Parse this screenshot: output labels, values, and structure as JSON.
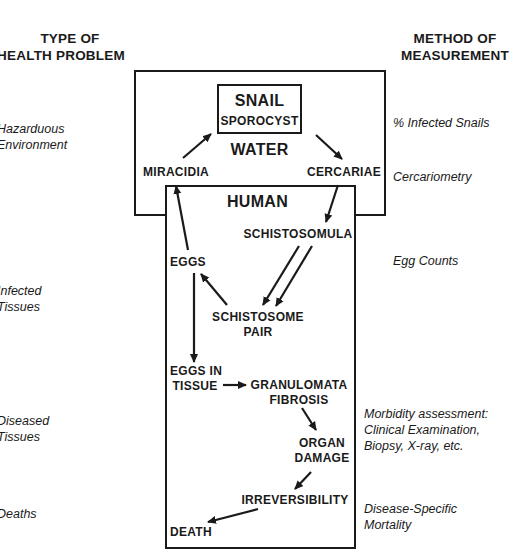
{
  "headers": {
    "left": [
      "TYPE OF",
      "HEALTH PROBLEM"
    ],
    "right": [
      "METHOD OF",
      "MEASUREMENT"
    ]
  },
  "health_problems": [
    {
      "lines": [
        "Hazarduous",
        "Environment"
      ]
    },
    {
      "lines": [
        "Infected",
        "Tissues"
      ]
    },
    {
      "lines": [
        "Diseased",
        "Tissues"
      ]
    },
    {
      "lines": [
        "Deaths"
      ]
    }
  ],
  "measurements": [
    {
      "lines": [
        "% Infected Snails"
      ]
    },
    {
      "lines": [
        "Cercariometry"
      ]
    },
    {
      "lines": [
        "Egg Counts"
      ]
    },
    {
      "lines": [
        "Morbidity assessment:",
        "Clinical Examination,",
        "Biopsy, X-ray, etc."
      ]
    },
    {
      "lines": [
        "Disease-Specific",
        "Mortality"
      ]
    }
  ],
  "diagram": {
    "snail_box": {
      "title": "SNAIL",
      "subtitle": "SPOROCYST"
    },
    "water_label": "WATER",
    "human_label": "HUMAN",
    "nodes": {
      "miracidia": "MIRACIDIA",
      "cercariae": "CERCARIAE",
      "schistosomula": "SCHISTOSOMULA",
      "eggs": "EGGS",
      "schistosome_pair": [
        "SCHISTOSOME",
        "PAIR"
      ],
      "eggs_in_tissue": [
        "EGGS IN",
        "TISSUE"
      ],
      "granulomata": [
        "GRANULOMATA",
        "FIBROSIS"
      ],
      "organ_damage": [
        "ORGAN",
        "DAMAGE"
      ],
      "irreversibility": "IRREVERSIBILITY",
      "death": "DEATH"
    },
    "edges": [
      {
        "from": "miracidia",
        "to": "snail_sporocyst"
      },
      {
        "from": "snail_sporocyst",
        "to": "cercariae"
      },
      {
        "from": "cercariae",
        "to": "schistosomula"
      },
      {
        "from": "schistosomula",
        "to": "schistosome_pair",
        "double": true
      },
      {
        "from": "schistosome_pair",
        "to": "eggs"
      },
      {
        "from": "eggs",
        "to": "miracidia"
      },
      {
        "from": "eggs",
        "to": "eggs_in_tissue"
      },
      {
        "from": "eggs_in_tissue",
        "to": "granulomata"
      },
      {
        "from": "granulomata",
        "to": "organ_damage"
      },
      {
        "from": "organ_damage",
        "to": "irreversibility"
      },
      {
        "from": "irreversibility",
        "to": "death"
      }
    ]
  }
}
